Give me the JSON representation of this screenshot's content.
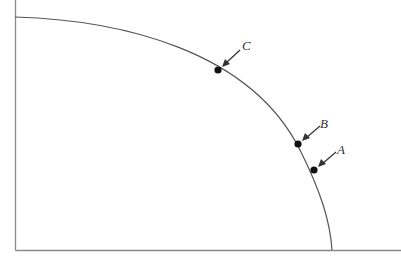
{
  "diagram": {
    "type": "production-possibilities-frontier",
    "colors": {
      "axis": "#8a8a8a",
      "curve": "#555555",
      "point": "#111111",
      "arrow": "#333333"
    },
    "points": [
      {
        "id": "C",
        "label": "C"
      },
      {
        "id": "B",
        "label": "B"
      },
      {
        "id": "A",
        "label": "A"
      }
    ]
  }
}
